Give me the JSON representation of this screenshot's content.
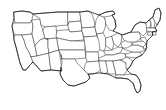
{
  "figure": {
    "kind": "map",
    "region": "Contiguous United States",
    "background_color": "#ffffff",
    "boundary_color": "#3a3a3a",
    "outline_color": "#1c1c1c",
    "fill_color": "#ffffff",
    "width_px": 166,
    "height_px": 110,
    "label_text": "",
    "legend_text": "",
    "scale_text": "",
    "attribution_text": ""
  },
  "map": {
    "projection_hint": "pseudo-albers",
    "view_box": "0 0 166 110",
    "state_count": 49,
    "states": [
      {
        "code": "WA",
        "name": "Washington",
        "d": "M14,12 L22,11 L30,12 L33,14 L32,20 L30,23 L22,23 L15,23 L14,18 Z"
      },
      {
        "code": "OR",
        "name": "Oregon",
        "d": "M14,23 L22,23 L30,23 L32,20 L33,27 L32,34 L22,35 L15,35 L13,31 L12,26 Z"
      },
      {
        "code": "CA",
        "name": "California",
        "d": "M15,35 L22,35 L24,40 L26,47 L29,52 L31,57 L33,62 L29,66 L26,70 L23,70 L20,63 L18,55 L16,47 L14,40 Z"
      },
      {
        "code": "NV",
        "name": "Nevada",
        "d": "M22,35 L32,34 L35,46 L37,56 L31,57 L29,52 L26,47 L24,40 Z"
      },
      {
        "code": "ID",
        "name": "Idaho",
        "d": "M32,20 L40,19 L41,25 L43,31 L45,38 L40,40 L35,46 L32,34 L33,27 Z"
      },
      {
        "code": "MT",
        "name": "Montana",
        "d": "M33,14 L45,13 L58,12 L68,12 L68,25 L56,26 L45,27 L41,25 L40,19 Z"
      },
      {
        "code": "WY",
        "name": "Wyoming",
        "d": "M45,27 L56,26 L57,38 L46,39 L45,38 L43,31 Z"
      },
      {
        "code": "UT",
        "name": "Utah",
        "d": "M40,40 L45,38 L46,39 L48,39 L48,47 L49,53 L37,56 L35,46 Z"
      },
      {
        "code": "AZ",
        "name": "Arizona",
        "d": "M37,56 L49,53 L50,64 L51,70 L41,71 L33,62 L31,57 Z"
      },
      {
        "code": "CO",
        "name": "Colorado",
        "d": "M46,39 L57,38 L59,50 L49,53 L48,47 L48,39 Z"
      },
      {
        "code": "NM",
        "name": "New Mexico",
        "d": "M49,53 L59,50 L61,63 L62,71 L51,70 L50,64 Z"
      },
      {
        "code": "ND",
        "name": "North Dakota",
        "d": "M68,12 L80,12 L81,21 L69,22 L68,25 Z"
      },
      {
        "code": "SD",
        "name": "South Dakota",
        "d": "M68,25 L69,22 L81,21 L82,31 L70,32 L69,30 Z"
      },
      {
        "code": "NE",
        "name": "Nebraska",
        "d": "M69,30 L70,32 L82,31 L84,40 L71,41 L57,38 L56,36 L57,31 Z"
      },
      {
        "code": "KS",
        "name": "Kansas",
        "d": "M57,38 L71,41 L85,41 L85,50 L59,50 Z"
      },
      {
        "code": "OK",
        "name": "Oklahoma",
        "d": "M59,50 L85,50 L86,58 L75,59 L62,59 L61,55 Z"
      },
      {
        "code": "TX",
        "name": "Texas",
        "d": "M61,55 L62,59 L75,59 L77,63 L80,66 L84,70 L88,74 L90,78 L86,82 L80,84 L74,86 L68,85 L63,80 L60,74 L61,67 L62,63 Z"
      },
      {
        "code": "MN",
        "name": "Minnesota",
        "d": "M80,12 L88,11 L92,14 L94,20 L95,27 L82,28 L81,21 Z"
      },
      {
        "code": "IA",
        "name": "Iowa",
        "d": "M82,28 L95,27 L97,36 L84,37 L82,31 Z"
      },
      {
        "code": "MO",
        "name": "Missouri",
        "d": "M84,37 L97,36 L100,41 L101,48 L98,52 L86,52 L85,45 Z"
      },
      {
        "code": "AR",
        "name": "Arkansas",
        "d": "M86,52 L98,52 L99,61 L87,62 L86,58 Z"
      },
      {
        "code": "LA",
        "name": "Louisiana",
        "d": "M87,62 L99,61 L101,69 L97,73 L92,74 L88,74 L84,70 L85,65 Z"
      },
      {
        "code": "WI",
        "name": "Wisconsin",
        "d": "M95,27 L96,20 L99,15 L103,16 L106,21 L105,28 L103,33 L97,34 Z"
      },
      {
        "code": "IL",
        "name": "Illinois",
        "d": "M97,34 L103,33 L106,38 L106,46 L104,51 L100,50 L99,42 Z"
      },
      {
        "code": "MI",
        "name": "Michigan",
        "d": "M104,16 L108,13 L112,15 L115,20 L116,27 L113,31 L109,30 L106,24 L105,19 Z"
      },
      {
        "code": "MI2",
        "name": "Michigan (Upper Peninsula)",
        "d": "M99,15 L106,12 L113,11 L115,14 L110,16 L104,17 Z"
      },
      {
        "code": "IN",
        "name": "Indiana",
        "d": "M106,38 L112,36 L114,44 L112,50 L106,46 Z"
      },
      {
        "code": "OH",
        "name": "Ohio",
        "d": "M112,36 L118,33 L122,35 L121,43 L118,47 L114,44 Z"
      },
      {
        "code": "KY",
        "name": "Kentucky",
        "d": "M104,51 L112,50 L118,47 L123,48 L120,53 L113,55 L106,55 Z"
      },
      {
        "code": "TN",
        "name": "Tennessee",
        "d": "M99,58 L106,55 L113,55 L120,53 L126,54 L125,59 L113,61 L100,61 Z"
      },
      {
        "code": "MS",
        "name": "Mississippi",
        "d": "M99,61 L106,61 L108,70 L106,74 L101,73 L100,68 Z"
      },
      {
        "code": "AL",
        "name": "Alabama",
        "d": "M106,61 L113,61 L115,70 L116,74 L108,74 L107,68 Z"
      },
      {
        "code": "GA",
        "name": "Georgia",
        "d": "M113,61 L121,60 L126,63 L127,70 L124,75 L116,75 L115,70 Z"
      },
      {
        "code": "FL",
        "name": "Florida",
        "d": "M116,75 L124,75 L131,74 L136,75 L139,79 L141,85 L140,91 L137,93 L135,89 L133,83 L128,79 L121,78 L116,78 Z"
      },
      {
        "code": "SC",
        "name": "South Carolina",
        "d": "M121,60 L127,57 L133,61 L130,67 L126,69 L126,63 Z"
      },
      {
        "code": "NC",
        "name": "North Carolina",
        "d": "M125,54 L126,54 L133,52 L140,52 L142,55 L136,58 L127,57 Z"
      },
      {
        "code": "VA",
        "name": "Virginia",
        "d": "M123,48 L131,45 L138,45 L143,47 L146,50 L140,52 L133,52 L126,50 Z"
      },
      {
        "code": "WV",
        "name": "West Virginia",
        "d": "M121,43 L126,40 L131,41 L132,45 L127,48 L123,48 Z"
      },
      {
        "code": "PA",
        "name": "Pennsylvania",
        "d": "M122,35 L131,32 L139,32 L141,38 L136,42 L128,42 L124,40 Z"
      },
      {
        "code": "NY",
        "name": "New York",
        "d": "M131,32 L135,25 L140,22 L146,23 L148,28 L146,33 L143,36 L139,32 Z"
      },
      {
        "code": "VT",
        "name": "Vermont",
        "d": "M146,23 L149,20 L151,23 L150,28 L147,28 Z"
      },
      {
        "code": "NH",
        "name": "New Hampshire",
        "d": "M150,19 L153,17 L155,22 L154,28 L151,28 L151,23 Z"
      },
      {
        "code": "ME",
        "name": "Maine",
        "d": "M153,17 L155,10 L159,8 L161,13 L160,20 L157,25 L155,22 Z"
      },
      {
        "code": "MA",
        "name": "Massachusetts",
        "d": "M147,28 L155,28 L157,31 L152,32 L147,31 Z"
      },
      {
        "code": "CT",
        "name": "Connecticut",
        "d": "M148,32 L153,32 L153,35 L148,35 Z"
      },
      {
        "code": "RI",
        "name": "Rhode Island",
        "d": "M153,32 L156,32 L156,35 L153,35 Z"
      },
      {
        "code": "NJ",
        "name": "New Jersey",
        "d": "M141,38 L145,37 L147,41 L145,46 L142,45 L141,41 Z"
      },
      {
        "code": "DE",
        "name": "Delaware",
        "d": "M143,45 L146,44 L147,48 L144,49 Z"
      },
      {
        "code": "MD",
        "name": "Maryland",
        "d": "M136,42 L143,41 L146,44 L143,47 L138,45 L132,45 L133,43 Z"
      }
    ],
    "nation_outline_d": "M14,12 L22,11 L30,12 L33,14 L45,13 L58,12 L68,12 L80,12 L88,11 L99,15 L106,12 L113,11 L115,14 L112,15 L115,20 L116,27 L113,31 L118,33 L122,35 L131,32 L135,25 L140,22 L146,23 L149,20 L153,17 L155,10 L159,8 L161,13 L160,20 L157,25 L155,28 L157,31 L152,32 L153,35 L147,41 L146,50 L142,55 L136,58 L133,61 L130,67 L127,70 L131,74 L136,75 L139,79 L141,85 L140,91 L137,93 L135,89 L133,83 L128,79 L121,78 L116,78 L108,74 L101,73 L97,73 L92,74 L88,74 L90,78 L86,82 L80,84 L74,86 L68,85 L63,80 L60,74 L61,67 L62,71 L51,70 L41,71 L33,62 L29,66 L26,70 L23,70 L20,63 L18,55 L16,47 L14,40 L13,31 L12,26 L14,18 Z"
  }
}
